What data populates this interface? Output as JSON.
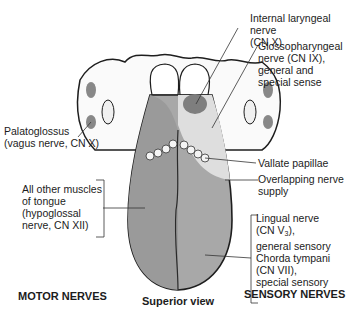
{
  "figure": {
    "view_label": "Superior view",
    "motor_header": "MOTOR NERVES",
    "sensory_header": "SENSORY NERVES"
  },
  "labels": {
    "internal_laryngeal": "Internal laryngeal nerve\n(CN X)",
    "glossopharyngeal": "Glossopharyngeal\nnerve (CN IX),\ngeneral and\nspecial sense",
    "palatoglossus": "Palatoglossus\n(vagus nerve, CN X)",
    "vallate_papillae": "Vallate papillae",
    "overlapping": "Overlapping nerve\nsupply",
    "other_muscles": "All other muscles\nof tongue\n(hypoglossal\nnerve, CN XII)",
    "lingual_line1": "Lingual nerve",
    "lingual_line2_pre": "(CN V",
    "lingual_sub": "3",
    "lingual_line2_post": "),",
    "lingual_rest": "general sensory\nChorda tympani\n(CN VII),\nspecial sensory"
  },
  "colors": {
    "motor_region": "#9a9a9a",
    "sensory_region": "#b4b4b4",
    "glossopharyngeal_region": "#dedede",
    "laryngeal_region": "#7e7e7e",
    "outline": "#1e1e1e"
  }
}
